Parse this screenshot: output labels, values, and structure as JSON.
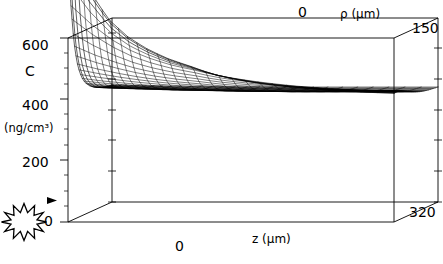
{
  "figure": {
    "kind": "3d-wireframe-surface-plot",
    "background": "#ffffff",
    "line_color": "#000000"
  },
  "axes": {
    "vertical": {
      "symbol": "C",
      "unit": "(ng/cm³)",
      "ticks": [
        "600",
        "400",
        "200",
        "0"
      ],
      "tick_values": [
        600,
        400,
        200,
        0
      ],
      "range": [
        0,
        600
      ]
    },
    "depth": {
      "label": "ρ (µm)",
      "origin": "0",
      "max": "150",
      "range": [
        0,
        150
      ]
    },
    "horizontal": {
      "label": "z (µm)",
      "origin": "0",
      "max": "320",
      "range": [
        0,
        320
      ]
    }
  },
  "markers": {
    "arrow": {
      "name": "background-level-arrow",
      "glyph": "▶",
      "value": 50
    },
    "star": {
      "name": "starburst-symbol",
      "points": 8
    }
  },
  "chart_data": {
    "type": "surface",
    "title": "",
    "xlabel": "z (µm)",
    "ylabel": "ρ (µm)",
    "zlabel": "C (ng/cm³)",
    "xlim": [
      0,
      320
    ],
    "ylim": [
      0,
      150
    ],
    "zlim": [
      0,
      600
    ],
    "xticks": [
      0,
      320
    ],
    "yticks": [
      0,
      150
    ],
    "zticks": [
      0,
      200,
      400,
      600
    ],
    "grid": false,
    "legend": null,
    "x": [
      0,
      20,
      40,
      60,
      80,
      100,
      120,
      140,
      160,
      180,
      200,
      220,
      240,
      260,
      280,
      300,
      320
    ],
    "y": [
      0,
      10,
      20,
      30,
      40,
      50,
      60,
      75,
      90,
      105,
      120,
      135,
      150
    ],
    "plateau_value": 400,
    "peak_value": 900,
    "z_values": [
      [
        900,
        760,
        660,
        600,
        560,
        530,
        508,
        484,
        468,
        456,
        447,
        440,
        434,
        429,
        425,
        422,
        420
      ],
      [
        700,
        640,
        590,
        552,
        526,
        506,
        492,
        476,
        464,
        454,
        446,
        439,
        434,
        429,
        425,
        422,
        420
      ],
      [
        580,
        548,
        522,
        500,
        484,
        472,
        463,
        452,
        445,
        439,
        434,
        430,
        427,
        424,
        422,
        420,
        419
      ],
      [
        510,
        492,
        477,
        464,
        454,
        446,
        440,
        433,
        428,
        425,
        422,
        420,
        418,
        417,
        416,
        415,
        415
      ],
      [
        470,
        459,
        449,
        441,
        434,
        429,
        425,
        420,
        417,
        415,
        413,
        412,
        411,
        411,
        410,
        410,
        410
      ],
      [
        444,
        436,
        430,
        424,
        420,
        416,
        413,
        410,
        408,
        406,
        405,
        405,
        404,
        404,
        404,
        404,
        404
      ],
      [
        427,
        421,
        417,
        413,
        410,
        407,
        405,
        403,
        401,
        400,
        399,
        399,
        399,
        399,
        399,
        399,
        399
      ],
      [
        411,
        407,
        404,
        402,
        399,
        397,
        396,
        394,
        393,
        393,
        392,
        392,
        392,
        392,
        392,
        392,
        392
      ],
      [
        400,
        397,
        395,
        393,
        391,
        390,
        389,
        388,
        387,
        387,
        386,
        386,
        386,
        386,
        386,
        386,
        386
      ],
      [
        393,
        391,
        389,
        387,
        386,
        385,
        384,
        383,
        382,
        382,
        382,
        382,
        382,
        382,
        382,
        382,
        382
      ],
      [
        388,
        386,
        385,
        383,
        382,
        381,
        381,
        380,
        379,
        379,
        379,
        379,
        379,
        379,
        379,
        379,
        379
      ],
      [
        384,
        383,
        382,
        380,
        379,
        379,
        378,
        377,
        377,
        377,
        377,
        377,
        377,
        377,
        377,
        377,
        377
      ],
      [
        382,
        380,
        379,
        378,
        377,
        377,
        376,
        376,
        375,
        375,
        375,
        375,
        375,
        375,
        375,
        375,
        375
      ]
    ]
  }
}
